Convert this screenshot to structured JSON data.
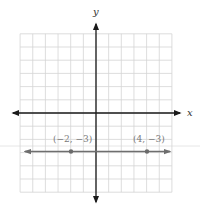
{
  "chart_data": {
    "type": "line",
    "title": "",
    "xlabel": "x",
    "ylabel": "y",
    "xlim": [
      -6,
      6
    ],
    "ylim": [
      -6,
      6
    ],
    "grid": true,
    "grid_step": 1,
    "legend": null,
    "series": [
      {
        "name": "y = -3",
        "kind": "horizontal line with arrows",
        "x": [
          -5.7,
          5.7
        ],
        "y": [
          -3,
          -3
        ],
        "color": "#6e6e6e"
      }
    ],
    "points": [
      {
        "x": -2,
        "y": -3,
        "label": "(−2, −3)"
      },
      {
        "x": 4,
        "y": -3,
        "label": "(4, −3)"
      }
    ]
  },
  "axes": {
    "x_label": "x",
    "y_label": "y"
  },
  "labels": {
    "p1": "(−2, −3)",
    "p2": "(4, −3)"
  },
  "colors": {
    "grid": "#d4d4d4",
    "axis": "#1a1a1a",
    "line": "#6e6e6e",
    "label": "#7a7a7a"
  }
}
